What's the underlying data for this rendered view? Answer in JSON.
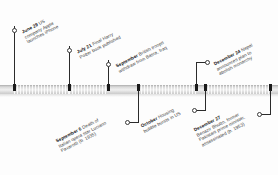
{
  "figure": {
    "name": "events-of-2007-timeline",
    "axis_color": "#d6d6d6",
    "marker_color": "#1a1a1a",
    "text_color": "#3c3c3c"
  },
  "events": [
    {
      "id": "jun-29-iphone",
      "date": "June 29",
      "text": "US company Apple launches iPhone",
      "lines": [
        "US",
        "company Apple",
        "launches iPhone"
      ],
      "side": "above"
    },
    {
      "id": "jul-21-potter",
      "date": "July 21",
      "text": "Final Harry Potter book published",
      "lines": [
        "Final Harry",
        "Potter book published"
      ],
      "side": "above"
    },
    {
      "id": "sep-basra",
      "date": "September",
      "text": "British troops withdraw from Basra, Iraq",
      "lines": [
        "British troops",
        "withdraw from Basra, Iraq"
      ],
      "side": "above"
    },
    {
      "id": "dec-24-nepal",
      "date": "December 24",
      "text": "Nepal announces plan to abolish monarchy",
      "lines": [
        "Nepal",
        "announces plan to",
        "abolish monarchy"
      ],
      "side": "above"
    },
    {
      "id": "sep-6-pavarotti",
      "date": "September 6",
      "text": "Death of Italian opera star Luciano Pavarotti (b. 1935)",
      "lines": [
        "Death of",
        "Italian opera star Luciano",
        "Pavarotti (b. 1935)"
      ],
      "side": "below"
    },
    {
      "id": "oct-housing",
      "date": "October",
      "text": "Housing bubble bursts in US",
      "lines": [
        "Housing",
        "bubble bursts in US"
      ],
      "side": "below"
    },
    {
      "id": "dec-27-bhutto",
      "date": "December 27",
      "text": "Benazir Bhutto, former Pakistani prime minister, assassinated (b. 1953)",
      "lines": [
        "Benazir Bhutto, former",
        "Pakistani prime minister,",
        "assassinated (b. 1953)"
      ],
      "side": "below"
    }
  ]
}
